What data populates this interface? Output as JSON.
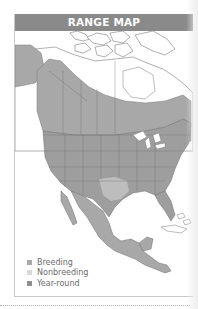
{
  "header": {
    "title": "RANGE MAP"
  },
  "legend": {
    "items": [
      {
        "label": "Breeding",
        "color": "#a8a8a8"
      },
      {
        "label": "Nonbreeding",
        "color": "#d8d8d8"
      },
      {
        "label": "Year-round",
        "color": "#8e8e8e"
      }
    ]
  },
  "map": {
    "region": "North and Central America",
    "colors": {
      "breeding": "#a8a8a8",
      "nonbreeding": "#d4d4d4",
      "year_round": "#9a9a9a",
      "land_outside_range": "#ffffff",
      "border_lines": "#6e6e6e"
    }
  }
}
